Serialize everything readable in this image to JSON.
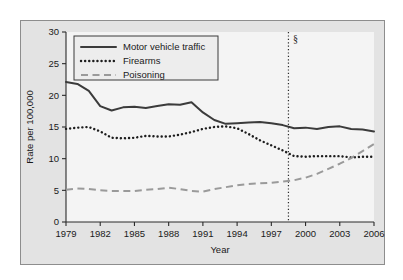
{
  "chart_data": {
    "type": "line",
    "title": "",
    "xlabel": "Year",
    "ylabel": "Rate per 100,000",
    "xlim": [
      1979,
      2006
    ],
    "ylim": [
      0,
      30
    ],
    "yticks": [
      0,
      5,
      10,
      15,
      20,
      25,
      30
    ],
    "xticks": [
      1979,
      1982,
      1985,
      1988,
      1991,
      1994,
      1997,
      2000,
      2003,
      2006
    ],
    "grid": false,
    "legend_position": "top-left",
    "x": [
      1979,
      1980,
      1981,
      1982,
      1983,
      1984,
      1985,
      1986,
      1987,
      1988,
      1989,
      1990,
      1991,
      1992,
      1993,
      1994,
      1995,
      1996,
      1997,
      1998,
      1999,
      2000,
      2001,
      2002,
      2003,
      2004,
      2005,
      2006
    ],
    "series": [
      {
        "name": "Motor vehicle traffic",
        "style": "solid",
        "color": "#3b3b3b",
        "values": [
          22.1,
          21.8,
          20.7,
          18.3,
          17.6,
          18.1,
          18.2,
          18.0,
          18.3,
          18.6,
          18.5,
          18.9,
          17.3,
          16.1,
          15.5,
          15.6,
          15.7,
          15.8,
          15.6,
          15.3,
          14.8,
          14.9,
          14.7,
          15.0,
          15.1,
          14.7,
          14.6,
          14.3
        ]
      },
      {
        "name": "Firearms",
        "style": "dotted",
        "color": "#1d1d1d",
        "values": [
          14.7,
          14.9,
          15.0,
          14.3,
          13.3,
          13.2,
          13.3,
          13.6,
          13.5,
          13.5,
          13.8,
          14.2,
          14.7,
          15.0,
          15.1,
          14.8,
          13.9,
          12.9,
          12.1,
          11.3,
          10.4,
          10.3,
          10.4,
          10.4,
          10.4,
          10.2,
          10.3,
          10.3
        ]
      },
      {
        "name": "Poisoning",
        "style": "dashed",
        "color": "#9a9a9a",
        "values": [
          5.1,
          5.3,
          5.2,
          5.0,
          4.9,
          4.9,
          4.9,
          5.1,
          5.2,
          5.4,
          5.2,
          4.9,
          4.8,
          5.2,
          5.5,
          5.8,
          6.0,
          6.1,
          6.2,
          6.4,
          6.6,
          7.0,
          7.6,
          8.4,
          9.2,
          10.1,
          11.2,
          12.3
        ]
      }
    ],
    "annotations": [
      {
        "name": "coding-change-marker",
        "symbol": "§",
        "x": 1998.5,
        "type": "vertical-dotted-line"
      }
    ]
  },
  "axes": {
    "y_title": "Rate per 100,000",
    "x_title": "Year",
    "y_tick_labels": [
      "0",
      "5",
      "10",
      "15",
      "20",
      "25",
      "30"
    ],
    "x_tick_labels": [
      "1979",
      "1982",
      "1985",
      "1988",
      "1991",
      "1994",
      "1997",
      "2000",
      "2003",
      "2006"
    ]
  },
  "legend": {
    "items": [
      {
        "label": "Motor vehicle traffic"
      },
      {
        "label": "Firearms"
      },
      {
        "label": "Poisoning"
      }
    ]
  },
  "marker": {
    "symbol": "§"
  },
  "colors": {
    "page_background": "#ffffff",
    "figure_background": "#e3e3e3",
    "plot_background": "#f4f4f4",
    "solid_series": "#3b3b3b",
    "dotted_series": "#1d1d1d",
    "dashed_series": "#9a9a9a",
    "axis": "#2b2b2b"
  }
}
